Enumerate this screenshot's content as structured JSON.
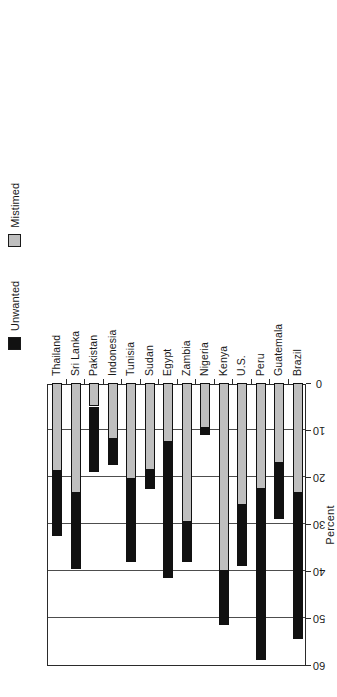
{
  "chart_data": {
    "type": "bar",
    "orientation": "horizontal",
    "stacked": true,
    "title": "",
    "xlabel": "Percent",
    "ylabel": "",
    "xlim": [
      0,
      60
    ],
    "xticks": [
      0,
      10,
      20,
      30,
      40,
      50,
      60
    ],
    "xtick_labels": [
      "0",
      "10",
      "20",
      "30",
      "40",
      "50",
      "60"
    ],
    "grid": true,
    "legend_position": "top-left",
    "categories": [
      "Brazil",
      "Guatemala",
      "Peru",
      "U.S.",
      "Kenya",
      "Nigeria",
      "Zambia",
      "Egypt",
      "Sudan",
      "Tunisia",
      "Indonesia",
      "Pakistan",
      "Sri Lanka",
      "Thailand"
    ],
    "series": [
      {
        "name": "Mistimed",
        "color": "#bfbfbf",
        "values": [
          23.5,
          17.0,
          22.5,
          26.0,
          40.0,
          9.5,
          29.5,
          12.5,
          18.5,
          20.5,
          12.0,
          5.0,
          23.5,
          18.7
        ]
      },
      {
        "name": "Unwanted",
        "color": "#111111",
        "values": [
          31.0,
          12.0,
          36.5,
          13.0,
          11.5,
          1.5,
          8.5,
          29.0,
          4.0,
          17.5,
          5.5,
          14.0,
          16.0,
          13.8
        ]
      }
    ],
    "totals": [
      54.5,
      29.0,
      59.0,
      39.0,
      51.5,
      11.0,
      38.0,
      41.5,
      22.5,
      38.0,
      17.5,
      19.0,
      39.5,
      32.5
    ]
  },
  "legend": {
    "entries": [
      {
        "label": "Unwanted",
        "swatch": "black-square-icon"
      },
      {
        "label": "Mistimed",
        "swatch": "gray-square-icon"
      }
    ]
  },
  "axes": {
    "value_axis_title": "Percent"
  }
}
